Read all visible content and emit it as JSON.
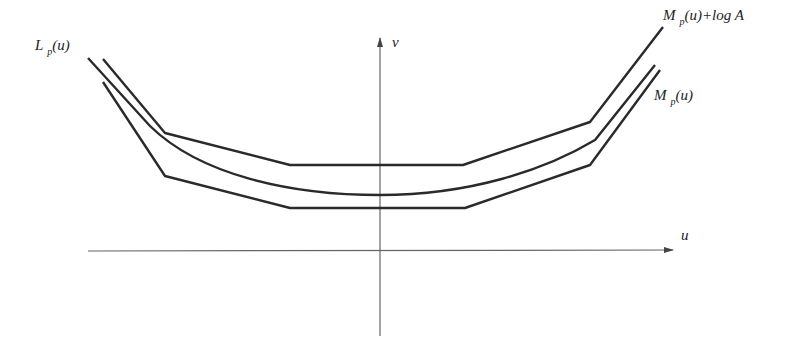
{
  "diagram": {
    "axes": {
      "x_label": "u",
      "y_label": "v"
    },
    "curves": [
      {
        "name": "upper",
        "label_main": "M",
        "label_sub": "p",
        "label_rest": "(u)+log A",
        "shape": "piecewise-linear"
      },
      {
        "name": "middle",
        "label_main": "L",
        "label_sub": "p",
        "label_rest": "(u)",
        "shape": "smooth-convex"
      },
      {
        "name": "lower",
        "label_main": "M",
        "label_sub": "p",
        "label_rest": "(u)",
        "shape": "piecewise-linear"
      }
    ],
    "colors": {
      "line": "#2a2a2a",
      "axis": "#555555",
      "background": "#ffffff"
    }
  }
}
